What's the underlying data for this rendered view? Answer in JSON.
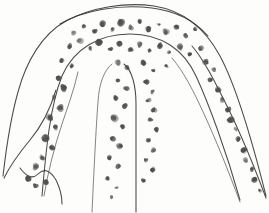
{
  "image": {
    "kind": "hand-drawn-sketch",
    "medium": "pencil-and-ink-on-white-paper",
    "subject": "branching tubular structure with stippled particles",
    "title": "",
    "caption": "",
    "width": 269,
    "height": 213,
    "background_color": "#fefefe",
    "ink_color": "#33312f",
    "stipple_color": "#4f4d4b",
    "has_text": false,
    "has_labels": false,
    "has_axes": false,
    "has_legend": false
  },
  "structure": {
    "form": "inverted-arch",
    "description": "An arch-shaped outlined channel spanning the top of the frame, with three descending limbs: a left limb angling down-left, a central narrow limb descending vertically, and a right limb sweeping down to the lower-right corner.",
    "limb_count": 3,
    "limbs": [
      {
        "name": "left-limb",
        "direction": "down-left",
        "terminates": "lower-left, open at a notched foot"
      },
      {
        "name": "center-limb",
        "direction": "straight-down",
        "terminates": "bottom edge of frame"
      },
      {
        "name": "right-limb",
        "direction": "down-right",
        "terminates": "lower-right corner of frame"
      }
    ],
    "crown": {
      "name": "arch-crown",
      "description": "Rounded dome across the upper third joining all limbs; densest stippling occurs here."
    },
    "interior_notches": [
      {
        "name": "left-inner-notch",
        "description": "Short inner contour separating left limb from center limb"
      },
      {
        "name": "right-inner-notch",
        "description": "Inner contour separating center limb from right limb"
      }
    ]
  },
  "outlines": [
    {
      "name": "arch-outer-contour",
      "path": "M 3 176 C 6 150 10 120 18 92 C 26 62 42 34 66 21 C 92 7 126 2 154 6 C 186 11 206 30 220 56 C 236 86 252 140 266 196"
    },
    {
      "name": "arch-inner-contour",
      "path": "M 42 196 C 46 150 50 106 62 76 C 74 48 100 34 130 34 C 162 34 184 50 196 76 C 208 102 226 150 240 200"
    },
    {
      "name": "center-limb-left-edge",
      "path": "M 92 212 C 94 170 96 128 98 102 C 99 84 104 70 112 64"
    },
    {
      "name": "center-limb-right-edge",
      "path": "M 136 212 C 136 170 136 130 136 104 C 136 86 132 70 124 64"
    },
    {
      "name": "left-limb-outer-edge",
      "path": "M 4 178 C 10 166 20 152 30 140 C 40 128 50 110 56 90"
    },
    {
      "name": "left-limb-inner-edge",
      "path": "M 44 196 C 48 172 54 148 62 124 C 68 106 74 90 78 72"
    },
    {
      "name": "left-foot-notch",
      "path": "M 20 168 C 26 176 32 180 38 174 C 44 168 50 170 56 180 C 60 188 62 196 62 204"
    },
    {
      "name": "right-limb-outer-edge",
      "path": "M 266 198 C 254 166 240 132 226 104 C 214 80 204 60 192 46"
    },
    {
      "name": "right-limb-inner-edge",
      "path": "M 240 202 C 228 170 216 140 204 114 C 194 92 184 72 172 58"
    },
    {
      "name": "crown-upper-rim",
      "path": "M 60 24 C 84 10 120 4 152 8 C 176 11 194 20 208 36"
    }
  ],
  "stipples": {
    "name": "stipple-field",
    "description": "Irregular dark pencil blobs of varying size scattered inside the channel walls, densest across the crown and along the inner walls of each limb.",
    "count": 86,
    "color": "#4f4d4b",
    "size_range_px": [
      1.2,
      5.5
    ],
    "points": [
      [
        74,
        33,
        3.1
      ],
      [
        84,
        26,
        2.2
      ],
      [
        94,
        31,
        2.8
      ],
      [
        103,
        24,
        3.6
      ],
      [
        112,
        30,
        2.4
      ],
      [
        121,
        22,
        4.2
      ],
      [
        131,
        28,
        3.0
      ],
      [
        140,
        21,
        2.6
      ],
      [
        149,
        29,
        3.4
      ],
      [
        158,
        24,
        2.0
      ],
      [
        166,
        32,
        3.8
      ],
      [
        176,
        27,
        2.9
      ],
      [
        186,
        35,
        3.2
      ],
      [
        195,
        30,
        2.3
      ],
      [
        70,
        46,
        2.7
      ],
      [
        80,
        41,
        3.5
      ],
      [
        90,
        48,
        2.1
      ],
      [
        100,
        42,
        3.9
      ],
      [
        110,
        49,
        2.5
      ],
      [
        120,
        43,
        3.3
      ],
      [
        130,
        50,
        2.8
      ],
      [
        140,
        44,
        4.0
      ],
      [
        150,
        51,
        2.2
      ],
      [
        160,
        45,
        3.1
      ],
      [
        170,
        52,
        2.6
      ],
      [
        180,
        47,
        3.4
      ],
      [
        190,
        54,
        2.4
      ],
      [
        200,
        49,
        3.0
      ],
      [
        62,
        60,
        2.9
      ],
      [
        72,
        66,
        2.3
      ],
      [
        118,
        62,
        3.6
      ],
      [
        128,
        68,
        2.7
      ],
      [
        143,
        63,
        3.2
      ],
      [
        154,
        70,
        2.5
      ],
      [
        166,
        66,
        2.1
      ],
      [
        206,
        62,
        3.3
      ],
      [
        214,
        70,
        2.8
      ],
      [
        58,
        78,
        3.0
      ],
      [
        64,
        88,
        3.7
      ],
      [
        118,
        80,
        2.4
      ],
      [
        126,
        88,
        3.1
      ],
      [
        146,
        82,
        2.9
      ],
      [
        152,
        92,
        2.2
      ],
      [
        210,
        80,
        2.6
      ],
      [
        218,
        90,
        3.4
      ],
      [
        54,
        98,
        3.3
      ],
      [
        60,
        108,
        4.1
      ],
      [
        116,
        98,
        2.8
      ],
      [
        124,
        106,
        3.5
      ],
      [
        148,
        100,
        2.3
      ],
      [
        154,
        110,
        3.0
      ],
      [
        222,
        100,
        2.7
      ],
      [
        228,
        110,
        3.2
      ],
      [
        50,
        118,
        3.8
      ],
      [
        56,
        128,
        3.1
      ],
      [
        114,
        118,
        4.2
      ],
      [
        122,
        126,
        2.6
      ],
      [
        150,
        120,
        3.4
      ],
      [
        156,
        130,
        2.9
      ],
      [
        230,
        120,
        3.6
      ],
      [
        236,
        130,
        2.4
      ],
      [
        46,
        138,
        4.4
      ],
      [
        52,
        148,
        3.2
      ],
      [
        112,
        138,
        3.0
      ],
      [
        120,
        146,
        3.7
      ],
      [
        148,
        140,
        2.5
      ],
      [
        154,
        150,
        3.1
      ],
      [
        238,
        140,
        2.8
      ],
      [
        244,
        150,
        3.5
      ],
      [
        42,
        158,
        3.6
      ],
      [
        36,
        166,
        4.0
      ],
      [
        110,
        158,
        2.7
      ],
      [
        118,
        166,
        3.3
      ],
      [
        146,
        160,
        2.2
      ],
      [
        152,
        170,
        2.9
      ],
      [
        246,
        160,
        3.0
      ],
      [
        252,
        170,
        2.6
      ],
      [
        28,
        178,
        3.4
      ],
      [
        36,
        186,
        2.8
      ],
      [
        46,
        182,
        3.1
      ],
      [
        108,
        178,
        2.4
      ],
      [
        116,
        188,
        2.0
      ],
      [
        144,
        180,
        2.7
      ],
      [
        254,
        180,
        3.2
      ],
      [
        260,
        190,
        2.5
      ],
      [
        112,
        198,
        1.8
      ]
    ]
  }
}
